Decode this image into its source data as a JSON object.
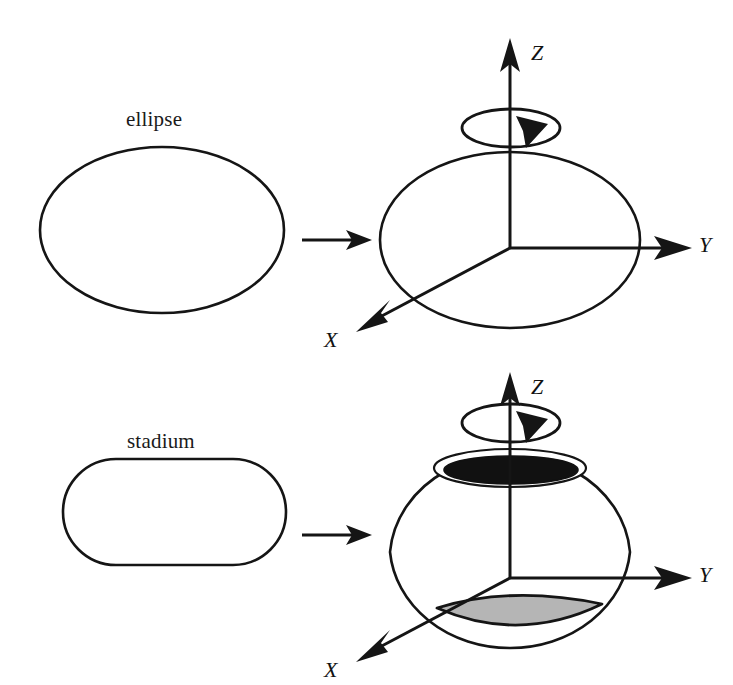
{
  "figure": {
    "background_color": "#ffffff",
    "stroke_color": "#151515",
    "dark_fill_color": "#111111",
    "gray_fill_color": "#b5b5b5",
    "panels": [
      {
        "id": "top-row",
        "source_caption": "ellipse",
        "result_description": "ellipsoid of revolution generated by rotating an ellipse about the Z axis",
        "axis_labels": {
          "z": "Z",
          "y": "Y",
          "x": "X"
        },
        "rotation_arrow": "clockwise-about-z"
      },
      {
        "id": "bottom-row",
        "source_caption": "stadium",
        "result_description": "body of revolution generated by rotating a stadium about the Z axis, with dark top opening and shaded bottom lens",
        "axis_labels": {
          "z": "Z",
          "y": "Y",
          "x": "X"
        },
        "rotation_arrow": "clockwise-about-z"
      }
    ],
    "transition_arrows": [
      {
        "id": "top-transition",
        "direction": "right"
      },
      {
        "id": "bottom-transition",
        "direction": "right"
      }
    ]
  },
  "captions": {
    "ellipse": "ellipse",
    "stadium": "stadium"
  },
  "axes": {
    "z_top": "Z",
    "y_top": "Y",
    "x_top": "X",
    "z_bottom": "Z",
    "y_bottom": "Y",
    "x_bottom": "X"
  }
}
